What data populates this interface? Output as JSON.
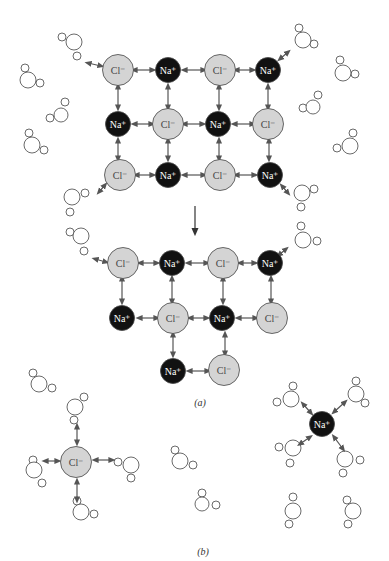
{
  "figure": {
    "caption_a": "(a)",
    "caption_b": "(b)",
    "colors": {
      "cl_fill": "#d4d4d4",
      "na_fill": "#111111",
      "stroke": "#444444",
      "arrow": "#555555",
      "water_stroke": "#444444"
    },
    "labels": {
      "cl": "Cl⁻",
      "na": "Na⁺"
    }
  },
  "panel_a_top": {
    "ions": [
      {
        "type": "cl",
        "x": 118,
        "y": 70
      },
      {
        "type": "na",
        "x": 168,
        "y": 70
      },
      {
        "type": "cl",
        "x": 220,
        "y": 70
      },
      {
        "type": "na",
        "x": 268,
        "y": 70
      },
      {
        "type": "na",
        "x": 118,
        "y": 124
      },
      {
        "type": "cl",
        "x": 168,
        "y": 124
      },
      {
        "type": "na",
        "x": 218,
        "y": 124
      },
      {
        "type": "cl",
        "x": 268,
        "y": 124
      },
      {
        "type": "cl",
        "x": 120,
        "y": 175
      },
      {
        "type": "na",
        "x": 168,
        "y": 175
      },
      {
        "type": "cl",
        "x": 220,
        "y": 175
      },
      {
        "type": "na",
        "x": 270,
        "y": 175
      }
    ]
  },
  "panel_a_bottom": {
    "ions": [
      {
        "type": "cl",
        "x": 123,
        "y": 263
      },
      {
        "type": "na",
        "x": 172,
        "y": 263
      },
      {
        "type": "cl",
        "x": 223,
        "y": 263
      },
      {
        "type": "na",
        "x": 270,
        "y": 263
      },
      {
        "type": "na",
        "x": 122,
        "y": 318
      },
      {
        "type": "cl",
        "x": 173,
        "y": 318
      },
      {
        "type": "na",
        "x": 222,
        "y": 318
      },
      {
        "type": "cl",
        "x": 272,
        "y": 318
      },
      {
        "type": "na",
        "x": 173,
        "y": 371
      },
      {
        "type": "cl",
        "x": 224,
        "y": 370
      }
    ]
  },
  "panel_b": {
    "ions": [
      {
        "type": "cl",
        "x": 76,
        "y": 462
      },
      {
        "type": "na",
        "x": 322,
        "y": 424
      }
    ]
  },
  "waters": [
    {
      "x": 74,
      "y": 42,
      "r": 8,
      "h": [
        [
          62,
          37
        ],
        [
          77,
          56
        ]
      ]
    },
    {
      "x": 28,
      "y": 80,
      "r": 8,
      "h": [
        [
          25,
          68
        ],
        [
          40,
          83
        ]
      ]
    },
    {
      "x": 61,
      "y": 115,
      "r": 7,
      "h": [
        [
          65,
          102
        ],
        [
          50,
          118
        ]
      ]
    },
    {
      "x": 32,
      "y": 145,
      "r": 8,
      "h": [
        [
          29,
          133
        ],
        [
          44,
          150
        ]
      ]
    },
    {
      "x": 303,
      "y": 40,
      "r": 8,
      "h": [
        [
          299,
          28
        ],
        [
          314,
          44
        ]
      ]
    },
    {
      "x": 343,
      "y": 73,
      "r": 8,
      "h": [
        [
          340,
          60
        ],
        [
          355,
          74
        ]
      ]
    },
    {
      "x": 313,
      "y": 107,
      "r": 7,
      "h": [
        [
          318,
          95
        ],
        [
          303,
          108
        ]
      ]
    },
    {
      "x": 350,
      "y": 146,
      "r": 8,
      "h": [
        [
          353,
          133
        ],
        [
          337,
          148
        ]
      ]
    },
    {
      "x": 72,
      "y": 197,
      "r": 8,
      "h": [
        [
          85,
          193
        ],
        [
          70,
          212
        ]
      ]
    },
    {
      "x": 302,
      "y": 193,
      "r": 8,
      "h": [
        [
          314,
          189
        ],
        [
          301,
          207
        ]
      ]
    },
    {
      "x": 81,
      "y": 236,
      "r": 8,
      "h": [
        [
          70,
          232
        ],
        [
          84,
          251
        ]
      ]
    },
    {
      "x": 303,
      "y": 240,
      "r": 8,
      "h": [
        [
          301,
          226
        ],
        [
          317,
          241
        ]
      ]
    },
    {
      "x": 39,
      "y": 384,
      "r": 8,
      "h": [
        [
          33,
          373
        ],
        [
          52,
          388
        ]
      ]
    },
    {
      "x": 75,
      "y": 407,
      "r": 8,
      "h": [
        [
          84,
          397
        ],
        [
          74,
          420
        ]
      ]
    },
    {
      "x": 34,
      "y": 470,
      "r": 8,
      "h": [
        [
          33,
          460
        ],
        [
          42,
          483
        ]
      ]
    },
    {
      "x": 131,
      "y": 465,
      "r": 8,
      "h": [
        [
          118,
          462
        ],
        [
          131,
          478
        ]
      ]
    },
    {
      "x": 81,
      "y": 512,
      "r": 8,
      "h": [
        [
          77,
          501
        ],
        [
          94,
          514
        ]
      ]
    },
    {
      "x": 180,
      "y": 461,
      "r": 8,
      "h": [
        [
          175,
          450
        ],
        [
          193,
          465
        ]
      ]
    },
    {
      "x": 202,
      "y": 504,
      "r": 7,
      "h": [
        [
          202,
          493
        ],
        [
          216,
          505
        ]
      ]
    },
    {
      "x": 291,
      "y": 399,
      "r": 8,
      "h": [
        [
          293,
          386
        ],
        [
          277,
          402
        ]
      ]
    },
    {
      "x": 356,
      "y": 394,
      "r": 8,
      "h": [
        [
          356,
          381
        ],
        [
          365,
          403
        ]
      ]
    },
    {
      "x": 293,
      "y": 448,
      "r": 8,
      "h": [
        [
          279,
          447
        ],
        [
          290,
          463
        ]
      ]
    },
    {
      "x": 345,
      "y": 459,
      "r": 8,
      "h": [
        [
          360,
          460
        ],
        [
          343,
          473
        ]
      ]
    },
    {
      "x": 293,
      "y": 511,
      "r": 8,
      "h": [
        [
          293,
          497
        ],
        [
          289,
          524
        ]
      ]
    },
    {
      "x": 353,
      "y": 511,
      "r": 8,
      "h": [
        [
          347,
          500
        ],
        [
          348,
          524
        ]
      ]
    }
  ],
  "arrows": [
    [
      88,
      63,
      101,
      66
    ],
    [
      288,
      52,
      280,
      59
    ],
    [
      99,
      192,
      105,
      185
    ],
    [
      288,
      193,
      282,
      186
    ],
    [
      95,
      259,
      106,
      262
    ],
    [
      286,
      249,
      279,
      255
    ],
    [
      134,
      70,
      153,
      70
    ],
    [
      184,
      70,
      204,
      70
    ],
    [
      236,
      70,
      253,
      70
    ],
    [
      134,
      124,
      152,
      124
    ],
    [
      184,
      124,
      203,
      124
    ],
    [
      234,
      124,
      253,
      124
    ],
    [
      136,
      175,
      153,
      175
    ],
    [
      184,
      175,
      204,
      175
    ],
    [
      236,
      175,
      255,
      175
    ],
    [
      118,
      86,
      118,
      108
    ],
    [
      168,
      86,
      168,
      108
    ],
    [
      219,
      86,
      219,
      108
    ],
    [
      268,
      86,
      268,
      108
    ],
    [
      118,
      140,
      118,
      159
    ],
    [
      168,
      140,
      168,
      159
    ],
    [
      219,
      140,
      219,
      159
    ],
    [
      269,
      140,
      269,
      159
    ],
    [
      140,
      263,
      157,
      263
    ],
    [
      188,
      263,
      207,
      263
    ],
    [
      240,
      263,
      255,
      263
    ],
    [
      139,
      318,
      157,
      318
    ],
    [
      190,
      318,
      207,
      318
    ],
    [
      238,
      318,
      256,
      318
    ],
    [
      122,
      278,
      122,
      302
    ],
    [
      172,
      278,
      172,
      302
    ],
    [
      223,
      278,
      223,
      302
    ],
    [
      271,
      278,
      271,
      302
    ],
    [
      173,
      334,
      173,
      355
    ],
    [
      225,
      334,
      225,
      354
    ],
    [
      189,
      371,
      208,
      371
    ],
    [
      77,
      426,
      77,
      443
    ],
    [
      77,
      481,
      77,
      500
    ],
    [
      45,
      461,
      58,
      461
    ],
    [
      95,
      460,
      112,
      460
    ],
    [
      303,
      404,
      311,
      413
    ],
    [
      345,
      402,
      334,
      412
    ],
    [
      310,
      437,
      300,
      444
    ],
    [
      334,
      437,
      343,
      449
    ]
  ],
  "main_arrow": [
    195,
    206,
    195,
    232
  ],
  "caption_positions": {
    "a": [
      200,
      406
    ],
    "b": [
      203,
      555
    ]
  }
}
